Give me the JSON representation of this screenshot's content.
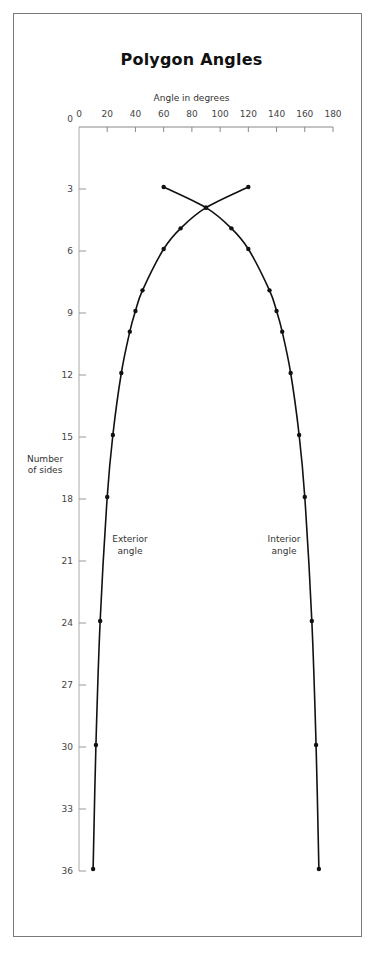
{
  "chart_data": {
    "type": "line",
    "title": "Polygon Angles",
    "xlabel": "Angle in degrees",
    "ylabel": [
      "Number",
      "of sides"
    ],
    "xlim": [
      0,
      180
    ],
    "ylim": [
      0,
      36
    ],
    "x_axis_position": "top",
    "y_axis_inverted": true,
    "xticks": [
      0,
      20,
      40,
      60,
      80,
      100,
      120,
      140,
      160,
      180
    ],
    "yticks": [
      0,
      3,
      6,
      9,
      12,
      15,
      18,
      21,
      24,
      27,
      30,
      33,
      36
    ],
    "grid": false,
    "series": [
      {
        "name": "Exterior angle",
        "label_lines": [
          "Exterior",
          "angle"
        ],
        "points": [
          [
            120,
            3
          ],
          [
            90,
            4
          ],
          [
            72,
            5
          ],
          [
            60,
            6
          ],
          [
            45,
            8
          ],
          [
            40,
            9
          ],
          [
            36,
            10
          ],
          [
            30,
            12
          ],
          [
            24,
            15
          ],
          [
            20,
            18
          ],
          [
            15,
            24
          ],
          [
            12,
            30
          ],
          [
            10,
            36
          ]
        ],
        "color": "#111111"
      },
      {
        "name": "Interior angle",
        "label_lines": [
          "Interior",
          "angle"
        ],
        "points": [
          [
            60,
            3
          ],
          [
            90,
            4
          ],
          [
            108,
            5
          ],
          [
            120,
            6
          ],
          [
            135,
            8
          ],
          [
            140,
            9
          ],
          [
            144,
            10
          ],
          [
            150,
            12
          ],
          [
            156,
            15
          ],
          [
            160,
            18
          ],
          [
            165,
            24
          ],
          [
            168,
            30
          ],
          [
            170,
            36
          ]
        ],
        "color": "#111111"
      }
    ]
  }
}
